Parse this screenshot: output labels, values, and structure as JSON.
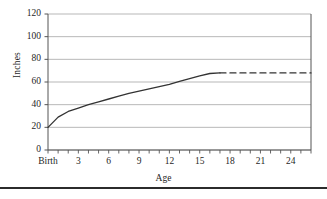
{
  "chart_data": {
    "type": "line",
    "title": "",
    "xlabel": "Age",
    "ylabel": "Inches",
    "ylim": [
      0,
      120
    ],
    "xlim": [
      0,
      26
    ],
    "grid": true,
    "legend": "none",
    "y_ticks": [
      0,
      20,
      40,
      60,
      80,
      100,
      120
    ],
    "y_tick_labels": [
      "0",
      "20",
      "40",
      "60",
      "80",
      "100",
      "120"
    ],
    "x_ticks": [
      0,
      3,
      6,
      9,
      12,
      15,
      18,
      21,
      24
    ],
    "x_tick_labels": [
      "Birth",
      "3",
      "6",
      "9",
      "12",
      "15",
      "18",
      "21",
      "24"
    ],
    "x_minor_tick_interval": 1,
    "series": [
      {
        "name": "Height",
        "style": "solid",
        "color": "#333333",
        "x": [
          0,
          1,
          2,
          3,
          4,
          5,
          6,
          7,
          8,
          9,
          10,
          11,
          12,
          13,
          14,
          15,
          16,
          17
        ],
        "values": [
          20,
          29,
          34,
          37,
          40,
          42.5,
          45,
          47.5,
          50,
          52,
          54,
          56,
          58,
          60.5,
          63,
          65.5,
          67.5,
          68
        ]
      },
      {
        "name": "Height (projected)",
        "style": "dashed",
        "color": "#333333",
        "x": [
          17,
          20,
          23,
          26
        ],
        "values": [
          68,
          68,
          68,
          68
        ]
      }
    ]
  },
  "axes": {
    "y_title": "Inches",
    "x_title": "Age"
  },
  "colors": {
    "line": "#333333",
    "grid": "#9a9a9a",
    "axis": "#555555",
    "text": "#1f1f1f",
    "rule": "#2b2b2b"
  },
  "footer": {
    "rule_present": "true"
  }
}
